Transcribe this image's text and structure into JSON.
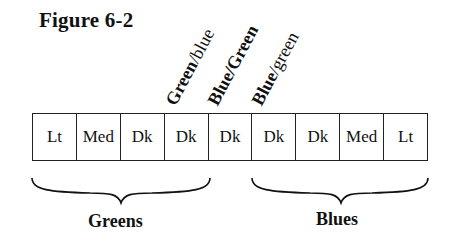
{
  "figure": {
    "title": "Figure 6-2",
    "rotated_labels": [
      {
        "bold": "Green",
        "normal": "/blue"
      },
      {
        "bold": "Blue/Green",
        "normal": ""
      },
      {
        "bold": "Blue",
        "normal": "/green"
      }
    ],
    "cells": [
      "Lt",
      "Med",
      "Dk",
      "Dk",
      "Dk",
      "Dk",
      "Dk",
      "Med",
      "Lt"
    ],
    "groups": [
      {
        "label": "Greens",
        "span": "cells 1-4"
      },
      {
        "label": "Blues",
        "span": "cells 6-9"
      }
    ]
  }
}
